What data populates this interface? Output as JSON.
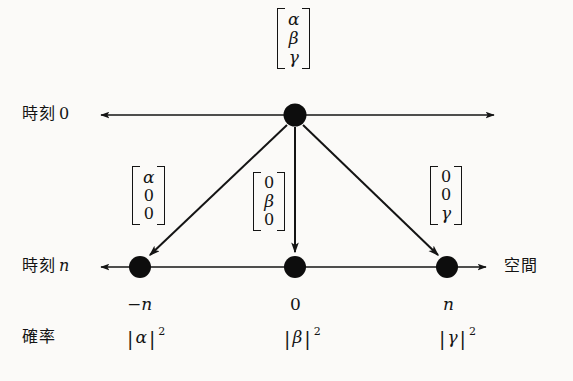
{
  "figure": {
    "kind": "quantum-walk-state-diagram",
    "background_color": "#fbfaf8",
    "ink_color": "#141414",
    "caption": ""
  },
  "axes": {
    "time0": {
      "row_label_word": "時刻",
      "row_label_index": "0",
      "y": 115,
      "x_start": 93,
      "x_end": 500,
      "left_arrow": true,
      "right_arrow": true
    },
    "timen": {
      "row_label_word": "時刻",
      "row_label_index": "n",
      "y": 267,
      "x_start": 93,
      "x_end": 492,
      "left_arrow": true,
      "right_arrow": true,
      "axis_name": "空間"
    }
  },
  "initial_state": {
    "label": "initial-state-vector",
    "entries": [
      "α",
      "β",
      "γ"
    ],
    "x": 295,
    "y": 45
  },
  "source_node": {
    "x": 295,
    "y": 115,
    "radius": 11
  },
  "branches": [
    {
      "id": "left",
      "position_label": "−n",
      "position_is_italic": true,
      "node": {
        "x": 140,
        "y": 267,
        "radius": 11
      },
      "vector": {
        "entries": [
          "α",
          "0",
          "0"
        ],
        "x": 154,
        "y": 203
      },
      "probability": {
        "symbol": "α",
        "exponent": "2"
      }
    },
    {
      "id": "center",
      "position_label": "0",
      "position_is_italic": false,
      "node": {
        "x": 295,
        "y": 267,
        "radius": 11
      },
      "vector": {
        "entries": [
          "0",
          "β",
          "0"
        ],
        "x": 272,
        "y": 207
      },
      "probability": {
        "symbol": "β",
        "exponent": "2"
      }
    },
    {
      "id": "right",
      "position_label": "n",
      "position_is_italic": true,
      "node": {
        "x": 447,
        "y": 267,
        "radius": 11
      },
      "vector": {
        "entries": [
          "0",
          "0",
          "γ"
        ],
        "x": 440,
        "y": 203
      },
      "probability": {
        "symbol": "γ",
        "exponent": "2"
      }
    }
  ],
  "probability_row": {
    "row_label": "確率",
    "y": 337
  },
  "position_row": {
    "y": 302
  }
}
